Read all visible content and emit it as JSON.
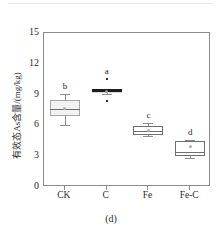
{
  "figure": {
    "caption": "(d)",
    "ylabel": "有效态As含量/(mg/kg)"
  },
  "chart_data": {
    "type": "box",
    "title": "",
    "xlabel": "",
    "ylabel": "有效态As含量/(mg/kg)",
    "ylim": [
      0,
      15
    ],
    "yticks": [
      0,
      3,
      6,
      9,
      12,
      15
    ],
    "ytick_labels": [
      "0",
      "3",
      "6",
      "9",
      "12",
      "15"
    ],
    "grid": false,
    "legend": false,
    "categories": [
      "CK",
      "C",
      "Fe",
      "Fe-C"
    ],
    "annotations": [
      "b",
      "a",
      "c",
      "d"
    ],
    "boxes": [
      {
        "category": "CK",
        "letter": "b",
        "fill": "#f2f2f2",
        "whisker_low": 6.0,
        "q1": 6.9,
        "median": 7.6,
        "mean": 7.6,
        "q3": 8.5,
        "whisker_high": 9.1,
        "outliers": []
      },
      {
        "category": "C",
        "letter": "a",
        "fill": "#1c1c1c",
        "whisker_low": 9.1,
        "q1": 9.15,
        "median": 9.3,
        "mean": 9.3,
        "q3": 9.5,
        "whisker_high": 9.55,
        "outliers": [
          10.5,
          8.4
        ]
      },
      {
        "category": "Fe",
        "letter": "c",
        "fill": "#ffffff",
        "whisker_low": 5.0,
        "q1": 5.05,
        "median": 5.5,
        "mean": 5.5,
        "q3": 5.9,
        "whisker_high": 6.2,
        "outliers": []
      },
      {
        "category": "Fe-C",
        "letter": "d",
        "fill": "#ffffff",
        "whisker_low": 2.8,
        "q1": 3.05,
        "median": 3.4,
        "mean": 3.9,
        "q3": 4.5,
        "whisker_high": 4.6,
        "outliers": []
      }
    ]
  }
}
